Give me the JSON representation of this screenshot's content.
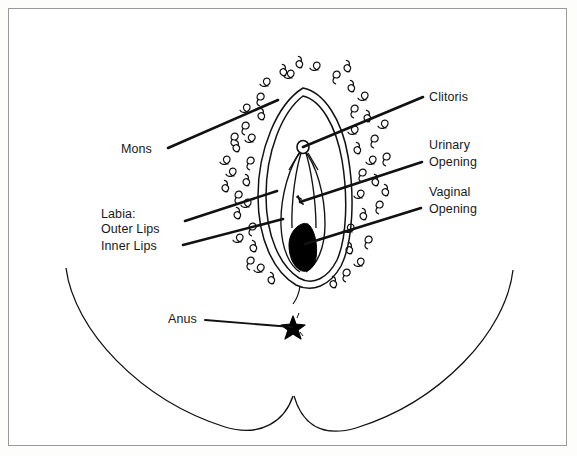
{
  "figure": {
    "background_color": "#ffffff",
    "border_color": "#9a9a9a",
    "ink_color": "#000000",
    "style": "black-and-white line drawing"
  },
  "labels": {
    "mons": "Mons",
    "labia_heading": "Labia:",
    "outer_lips": "Outer Lips",
    "inner_lips": "Inner Lips",
    "clitoris": "Clitoris",
    "urinary_line1": "Urinary",
    "urinary_line2": "Opening",
    "vaginal_line1": "Vaginal",
    "vaginal_line2": "Opening",
    "anus": "Anus"
  },
  "parts": [
    {
      "id": "mons",
      "label": "Mons",
      "side": "left",
      "leader_from": [
        168,
        148
      ],
      "leader_to": [
        278,
        100
      ]
    },
    {
      "id": "outer-lips",
      "label": "Outer Lips",
      "side": "left",
      "leader_from": [
        185,
        221
      ],
      "leader_to": [
        277,
        191
      ]
    },
    {
      "id": "inner-lips",
      "label": "Inner Lips",
      "side": "left",
      "leader_from": [
        183,
        245
      ],
      "leader_to": [
        283,
        219
      ]
    },
    {
      "id": "clitoris",
      "label": "Clitoris",
      "side": "right",
      "leader_from": [
        423,
        97
      ],
      "leader_to": [
        303,
        147
      ]
    },
    {
      "id": "urinary-opening",
      "label": "Urinary Opening",
      "side": "right",
      "leader_from": [
        422,
        162
      ],
      "leader_to": [
        300,
        202
      ]
    },
    {
      "id": "vaginal-opening",
      "label": "Vaginal Opening",
      "side": "right",
      "leader_from": [
        421,
        208
      ],
      "leader_to": [
        305,
        244
      ]
    },
    {
      "id": "anus",
      "label": "Anus",
      "side": "left",
      "leader_from": [
        205,
        320
      ],
      "leader_to": [
        292,
        327
      ]
    }
  ],
  "anatomy": {
    "mons_hair": "curly pubic hair marks",
    "vaginal_opening_fill": "#000000",
    "clitoris_marker": "small circle",
    "anus_marker": "star shape",
    "buttocks": "two large curves meeting at center point"
  }
}
